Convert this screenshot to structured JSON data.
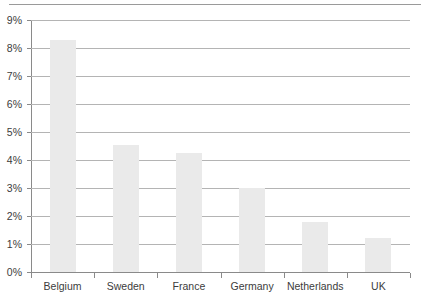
{
  "chart_data": {
    "type": "bar",
    "title": "",
    "subtitle": "",
    "xlabel": "",
    "ylabel": "",
    "categories": [
      "Belgium",
      "Sweden",
      "France",
      "Germany",
      "Netherlands",
      "UK"
    ],
    "values": [
      8.3,
      4.55,
      4.25,
      3.0,
      1.8,
      1.2
    ],
    "value_unit": "%",
    "ylim": [
      0,
      9
    ],
    "ytick_values": [
      0,
      1,
      2,
      3,
      4,
      5,
      6,
      7,
      8,
      9
    ],
    "ytick_labels": [
      "0%",
      "1%",
      "2%",
      "3%",
      "4%",
      "5%",
      "6%",
      "7%",
      "8%",
      "9%"
    ],
    "grid": true,
    "grid_axis": "y",
    "legend": null,
    "bar_color": "#eaeaea",
    "grid_color": "#b4b4b4",
    "axis_color": "#8a8a8a",
    "text_color": "#3c3c3c",
    "background_color": "#ffffff"
  }
}
